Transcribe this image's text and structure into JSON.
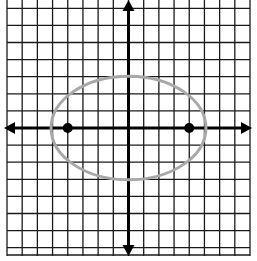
{
  "diagram": {
    "type": "coordinate-grid-with-ellipse",
    "grid": {
      "x_min": -8,
      "x_max": 8,
      "y_min": -8,
      "y_max": 8,
      "grid_color": "#1a1a1a",
      "axis_color": "#000000"
    },
    "ellipse": {
      "center": [
        0,
        0
      ],
      "semi_major_horizontal": 5,
      "semi_minor_vertical": 3,
      "stroke_color": "#a8a8a8"
    },
    "foci": [
      {
        "x": -4,
        "y": 0
      },
      {
        "x": 4,
        "y": 0
      }
    ],
    "point_color": "#000000"
  }
}
